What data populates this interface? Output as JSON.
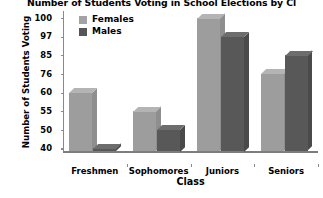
{
  "chart_data": {
    "type": "bar",
    "title": "Number of Students Voting in School Elections by Cl",
    "xlabel": "Class",
    "ylabel": "Number of Students Voting",
    "categories": [
      "Freshmen",
      "Sophomores",
      "Juniors",
      "Seniors"
    ],
    "series": [
      {
        "name": "Females",
        "values": [
          60,
          55,
          100,
          76
        ],
        "color": "#9d9d9d"
      },
      {
        "name": "Males",
        "values": [
          40,
          50,
          97,
          85
        ],
        "color": "#585858"
      }
    ],
    "yticks": [
      100,
      97,
      85,
      76,
      60,
      55,
      50,
      40
    ],
    "ytick_spacing": "uniform",
    "ylim": [
      40,
      100
    ],
    "grid": false,
    "legend_position": "top-left-inside",
    "style": "3d-extruded-bars"
  },
  "legend": {
    "items": [
      {
        "label": "Females",
        "swatch": "legend-swatch-females"
      },
      {
        "label": "Males",
        "swatch": "legend-swatch-males"
      }
    ]
  }
}
